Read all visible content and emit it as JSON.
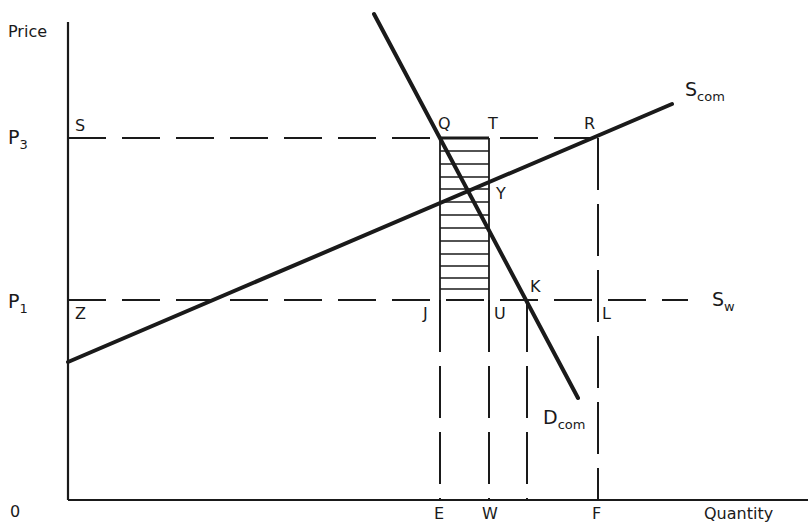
{
  "diagram": {
    "type": "economics-supply-demand",
    "axes": {
      "y_label": "Price",
      "x_label": "Quantity",
      "origin_label": "0"
    },
    "price_levels": [
      {
        "name": "P3",
        "main": "P",
        "sub": "3"
      },
      {
        "name": "P1",
        "main": "P",
        "sub": "1"
      }
    ],
    "curves": [
      {
        "id": "s_com",
        "label_main": "S",
        "label_sub": "com",
        "kind": "supply",
        "style": "solid-thick"
      },
      {
        "id": "d_com",
        "label_main": "D",
        "label_sub": "com",
        "kind": "demand",
        "style": "solid-thick"
      },
      {
        "id": "s_w",
        "label_main": "S",
        "label_sub": "w",
        "kind": "world-supply",
        "style": "dashed"
      }
    ],
    "points": {
      "S": "S",
      "Q": "Q",
      "T": "T",
      "R": "R",
      "Y": "Y",
      "Z": "Z",
      "J": "J",
      "U": "U",
      "K": "K",
      "L": "L"
    },
    "x_ticks": [
      "E",
      "W",
      "F"
    ],
    "shaded_region": {
      "corners": [
        "Q",
        "T",
        "U",
        "J"
      ],
      "pattern": "horizontal-hatch"
    },
    "colors": {
      "ink": "#1a1a1a",
      "background": "#ffffff"
    }
  }
}
